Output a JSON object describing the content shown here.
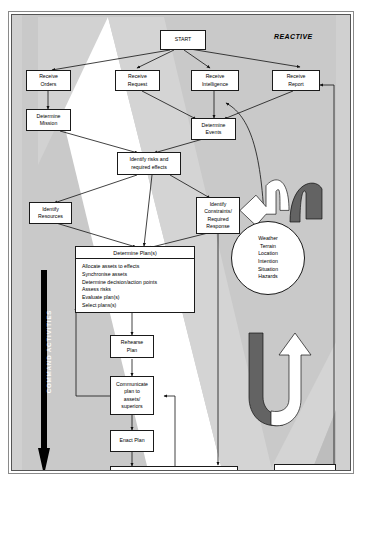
{
  "diagram": {
    "corner_labels": {
      "top_right": "REACTIVE",
      "bottom_left": "PROACTIVE"
    },
    "vertical_arrow_label": "COMMAND ACTIVITIES",
    "colors": {
      "background_gray": "#c9c9c9",
      "band_white": "#ffffff",
      "band_light": "#d8d8d8",
      "arc_dark": "#636363",
      "arrow_black": "#000000",
      "outline": "#1a1a1a"
    },
    "nodes": {
      "start": "START",
      "receive_orders": "Receive\nOrders",
      "receive_request": "Receive\nRequest",
      "receive_intelligence": "Receive\nIntelligence",
      "receive_report": "Receive\nReport",
      "determine_mission": "Determine\nMission",
      "determine_events": "Determine\nEvents",
      "identify_risks": "Identify risks and\nrequired effects",
      "identify_resources": "Identify\nResources",
      "identify_constraints": "Identify\nConstraints/\nRequired\nResponse",
      "rehearse_plan": "Rehearse\nPlan",
      "communicate_plan": "Communicate\nplan to\nassets/\nsuperiors",
      "enact_plan": "Enact Plan",
      "monitor": "Monitor progress and review",
      "request_situation_report": "Request Situation\nReport",
      "end": "END"
    },
    "plan_box": {
      "title": "Determine Plan(s)",
      "items": [
        "Allocate assets to effects",
        "Synchronise assets",
        "Determine decision/action points",
        "Assess risks",
        "Evaluate plan(s)",
        "Select plans(s)"
      ]
    },
    "knowledge_circle": {
      "items": [
        "Weather",
        "Terrain",
        "Location",
        "Intention",
        "Situation",
        "Hazards"
      ]
    }
  }
}
